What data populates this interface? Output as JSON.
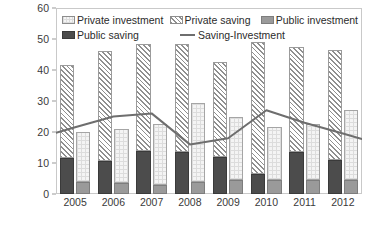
{
  "legend": {
    "items": [
      {
        "label": "Private investment",
        "marker": "swatch-private-investment"
      },
      {
        "label": "Private saving",
        "marker": "swatch-private-saving"
      },
      {
        "label": "Public investment",
        "marker": "swatch-public-investment"
      },
      {
        "label": "Public saving",
        "marker": "swatch-public-saving"
      },
      {
        "label": "Saving-Investment",
        "marker": "line-saving-investment"
      }
    ]
  },
  "axes": {
    "y_ticks": [
      "0",
      "10",
      "20",
      "30",
      "40",
      "50",
      "60"
    ],
    "x_ticks": [
      "2005",
      "2006",
      "2007",
      "2008",
      "2009",
      "2010",
      "2011",
      "2012"
    ]
  },
  "colors": {
    "private_saving": "#f2f2f2",
    "public_saving": "#4c4c4c",
    "private_investment": "#f4f4f4",
    "public_investment": "#9a9a9a",
    "line": "#6e6e6e",
    "axis_text": "#3a3a3a",
    "frame": "#c9c9c9"
  },
  "chart_data": {
    "type": "bar",
    "title": "",
    "subtitle": "",
    "xlabel": "",
    "ylabel": "",
    "ylim": [
      0,
      60
    ],
    "ytick_step": 10,
    "grid": false,
    "legend_position": "top-inside",
    "categories": [
      "2005",
      "2006",
      "2007",
      "2008",
      "2009",
      "2010",
      "2011",
      "2012"
    ],
    "stacked": true,
    "bar_groups": [
      {
        "name": "Saving",
        "position": "left",
        "stack_order": [
          "Public saving",
          "Private saving"
        ],
        "series": [
          {
            "name": "Public saving",
            "values": [
              11.5,
              10.5,
              14.0,
              13.5,
              12.0,
              6.5,
              13.5,
              11.0
            ]
          },
          {
            "name": "Private saving",
            "values": [
              30.0,
              35.5,
              34.5,
              35.0,
              30.5,
              42.5,
              34.0,
              35.5
            ]
          }
        ],
        "totals": [
          41.5,
          46.0,
          48.5,
          48.5,
          42.5,
          49.0,
          47.5,
          46.5
        ]
      },
      {
        "name": "Investment",
        "position": "right",
        "stack_order": [
          "Public investment",
          "Private investment"
        ],
        "series": [
          {
            "name": "Public investment",
            "values": [
              4.0,
              3.5,
              3.0,
              4.0,
              4.5,
              4.5,
              4.5,
              4.5
            ]
          },
          {
            "name": "Private investment",
            "values": [
              16.0,
              17.5,
              19.5,
              25.5,
              20.5,
              17.0,
              18.0,
              22.5
            ]
          }
        ],
        "totals": [
          20.0,
          21.0,
          22.5,
          29.5,
          25.0,
          21.5,
          22.5,
          27.0
        ]
      }
    ],
    "line_series": {
      "name": "Saving-Investment",
      "values": [
        21.5,
        25.0,
        26.0,
        22.5,
        16.0,
        18.0,
        27.0,
        23.0,
        19.5
      ]
    },
    "line_series_points": [
      21.5,
      25.0,
      26.0,
      16.0,
      18.0,
      27.0,
      23.0,
      19.5
    ]
  }
}
